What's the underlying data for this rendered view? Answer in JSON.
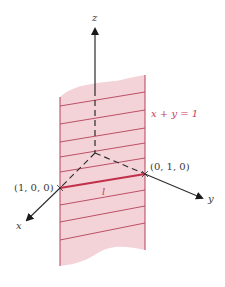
{
  "figure": {
    "colors": {
      "plane_fill": "#f3d2d8",
      "hatch_line": "#b54258",
      "line_l": "#c0304a",
      "axis": "#2a2a2a",
      "plane_label": "#c23a5a",
      "coord_label": "#3a3a3a"
    },
    "axes": {
      "x_label": "x",
      "y_label": "y",
      "z_label": "z"
    },
    "plane": {
      "equation_label": "x + y = 1"
    },
    "line": {
      "label": "l"
    },
    "points": [
      {
        "label": "(1, 0, 0)"
      },
      {
        "label": "(0, 1, 0)"
      }
    ]
  }
}
